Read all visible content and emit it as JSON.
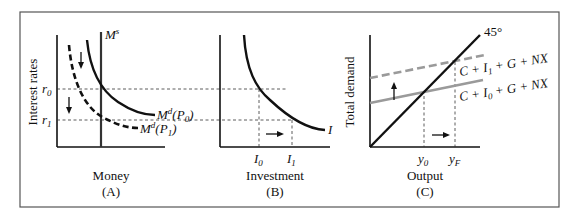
{
  "figure": {
    "panels": [
      {
        "id": "A",
        "caption": "(A)",
        "xlabel": "Money",
        "ylabel": "Interest rates",
        "supply_label": "M",
        "supply_sup": "s",
        "curve0_label": "M",
        "curve0_sup": "d",
        "curve0_arg": "(P",
        "curve0_sub": "0",
        "curve0_close": ")",
        "curve1_label": "M",
        "curve1_sup": "d",
        "curve1_arg": "(P",
        "curve1_sub": "1",
        "curve1_close": ")",
        "r0": "r",
        "r0_sub": "0",
        "r1": "r",
        "r1_sub": "1"
      },
      {
        "id": "B",
        "caption": "(B)",
        "xlabel": "Investment",
        "curve_label": "I",
        "tick0": "I",
        "tick0_sub": "0",
        "tick1": "I",
        "tick1_sub": "1"
      },
      {
        "id": "C",
        "caption": "(C)",
        "xlabel": "Output",
        "ylabel": "Total demand",
        "line45_label": "45°",
        "upper_label_a": "C + I",
        "upper_label_sub": "1",
        "upper_label_b": " + G + NX",
        "lower_label_a": "C + I",
        "lower_label_sub": "0",
        "lower_label_b": " + G + NX",
        "tick0": "y",
        "tick0_sub": "0",
        "tickF": "y",
        "tickF_sub": "F"
      }
    ],
    "colors": {
      "ink": "#111111",
      "gray_line": "#9a9a9a",
      "frame": "#555555"
    }
  }
}
